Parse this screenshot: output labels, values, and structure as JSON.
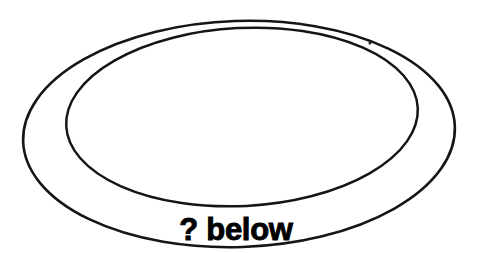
{
  "canvas": {
    "width": 481,
    "height": 253,
    "background_color": "#ffffff"
  },
  "diagram": {
    "kind": "concentric-ellipse-ring",
    "stroke_color": "#151515",
    "fill_color": "none",
    "outer_ellipse": {
      "name": "outer-ellipse",
      "center_x": 239,
      "center_y": 134,
      "radius_x": 216,
      "radius_y": 113,
      "rotation_deg": -2,
      "stroke_width": 2.6
    },
    "inner_ellipse": {
      "name": "inner-ellipse",
      "center_x": 242,
      "center_y": 117,
      "radius_x": 176,
      "radius_y": 89,
      "rotation_deg": -3,
      "stroke_width": 2.5
    },
    "artifact_speck": {
      "name": "scan-speck",
      "center_x": 370,
      "center_y": 43,
      "radius": 1.6,
      "color": "#2a2a2a"
    }
  },
  "caption": {
    "text": "? below",
    "color": "#000000",
    "font_size_px": 31,
    "weight": "bold",
    "center_x": 236,
    "baseline_y": 240
  }
}
